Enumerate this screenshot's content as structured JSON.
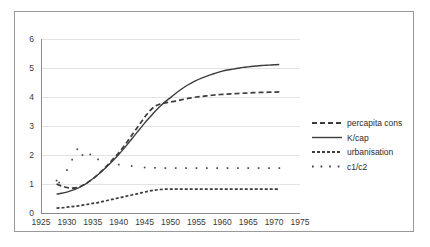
{
  "chart_data": {
    "type": "line",
    "title": "",
    "xlabel": "",
    "ylabel": "",
    "xlim": [
      1925,
      1975
    ],
    "ylim": [
      0,
      6
    ],
    "xticks": [
      1925,
      1930,
      1935,
      1940,
      1945,
      1950,
      1955,
      1960,
      1965,
      1970,
      1975
    ],
    "yticks": [
      0,
      1,
      2,
      3,
      4,
      5,
      6
    ],
    "grid": "horizontal",
    "legend_position": "right",
    "series": [
      {
        "name": "percapita cons",
        "style": "dashed",
        "x": [
          1928,
          1929,
          1930,
          1931,
          1932,
          1933,
          1934,
          1935,
          1936,
          1937,
          1938,
          1939,
          1940,
          1941,
          1942,
          1943,
          1944,
          1945,
          1946,
          1947,
          1948,
          1949,
          1950,
          1951,
          1952,
          1953,
          1954,
          1955,
          1956,
          1957,
          1958,
          1959,
          1960,
          1961,
          1962,
          1963,
          1964,
          1965,
          1966,
          1967,
          1968,
          1969,
          1970,
          1971
        ],
        "values": [
          1.0,
          0.93,
          0.88,
          0.86,
          0.88,
          0.95,
          1.05,
          1.18,
          1.33,
          1.5,
          1.68,
          1.88,
          2.08,
          2.3,
          2.55,
          2.8,
          3.05,
          3.3,
          3.52,
          3.68,
          3.76,
          3.8,
          3.83,
          3.86,
          3.9,
          3.94,
          3.97,
          4.0,
          4.02,
          4.04,
          4.06,
          4.08,
          4.09,
          4.1,
          4.11,
          4.12,
          4.13,
          4.14,
          4.15,
          4.155,
          4.16,
          4.165,
          4.17,
          4.18
        ]
      },
      {
        "name": "K/cap",
        "style": "solid",
        "x": [
          1928,
          1929,
          1930,
          1931,
          1932,
          1933,
          1934,
          1935,
          1936,
          1937,
          1938,
          1939,
          1940,
          1941,
          1942,
          1943,
          1944,
          1945,
          1946,
          1947,
          1948,
          1949,
          1950,
          1951,
          1952,
          1953,
          1954,
          1955,
          1956,
          1957,
          1958,
          1959,
          1960,
          1961,
          1962,
          1963,
          1964,
          1965,
          1966,
          1967,
          1968,
          1969,
          1970,
          1971
        ],
        "values": [
          0.65,
          0.68,
          0.72,
          0.78,
          0.85,
          0.94,
          1.05,
          1.18,
          1.32,
          1.48,
          1.65,
          1.83,
          2.02,
          2.22,
          2.44,
          2.66,
          2.88,
          3.1,
          3.3,
          3.5,
          3.68,
          3.84,
          3.98,
          4.12,
          4.26,
          4.38,
          4.48,
          4.57,
          4.65,
          4.72,
          4.78,
          4.84,
          4.89,
          4.93,
          4.96,
          4.99,
          5.02,
          5.04,
          5.06,
          5.08,
          5.09,
          5.1,
          5.11,
          5.12
        ]
      },
      {
        "name": "urbanisation",
        "style": "dash-dot",
        "x": [
          1928,
          1929,
          1930,
          1931,
          1932,
          1933,
          1934,
          1935,
          1936,
          1937,
          1938,
          1939,
          1940,
          1941,
          1942,
          1943,
          1944,
          1945,
          1946,
          1947,
          1948,
          1949,
          1950,
          1951,
          1952,
          1953,
          1954,
          1955,
          1956,
          1957,
          1958,
          1959,
          1960,
          1961,
          1962,
          1963,
          1964,
          1965,
          1966,
          1967,
          1968,
          1969,
          1970,
          1971
        ],
        "values": [
          0.17,
          0.18,
          0.2,
          0.22,
          0.24,
          0.27,
          0.3,
          0.33,
          0.36,
          0.4,
          0.44,
          0.48,
          0.52,
          0.56,
          0.6,
          0.64,
          0.68,
          0.72,
          0.76,
          0.79,
          0.81,
          0.82,
          0.82,
          0.82,
          0.82,
          0.82,
          0.82,
          0.82,
          0.82,
          0.82,
          0.82,
          0.82,
          0.82,
          0.82,
          0.82,
          0.82,
          0.82,
          0.82,
          0.82,
          0.82,
          0.82,
          0.82,
          0.82,
          0.82
        ]
      },
      {
        "name": "c1/c2",
        "style": "dotted-markers",
        "x": [
          1928,
          1928.5,
          1930,
          1931,
          1932,
          1933,
          1934.5,
          1936,
          1940,
          1942.5,
          1945,
          1947,
          1949,
          1951,
          1953,
          1955,
          1957,
          1959,
          1961,
          1963,
          1965,
          1967,
          1969,
          1971
        ],
        "values": [
          1.12,
          1.05,
          1.48,
          1.84,
          2.2,
          2.0,
          2.02,
          1.85,
          1.67,
          1.62,
          1.57,
          1.56,
          1.55,
          1.55,
          1.55,
          1.55,
          1.55,
          1.55,
          1.55,
          1.55,
          1.55,
          1.55,
          1.55,
          1.55
        ]
      }
    ]
  },
  "legend": {
    "items": [
      {
        "label": "percapita cons",
        "swatch": "dashed"
      },
      {
        "label": "K/cap",
        "swatch": "solid"
      },
      {
        "label": "urbanisation",
        "swatch": "dash-dot"
      },
      {
        "label": "c1/c2",
        "swatch": "dotted-markers"
      }
    ]
  }
}
